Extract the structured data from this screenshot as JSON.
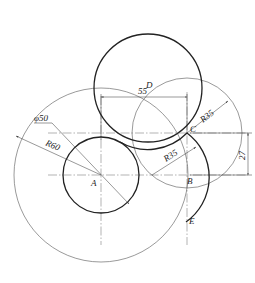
{
  "drawing": {
    "title": "",
    "points": [
      {
        "id": "A",
        "label": "A"
      },
      {
        "id": "B",
        "label": "B"
      },
      {
        "id": "C",
        "label": "C"
      },
      {
        "id": "D",
        "label": "D"
      },
      {
        "id": "E",
        "label": "E"
      }
    ],
    "dimensions": {
      "dia_small": "φ50",
      "radius_large": "R60",
      "radius_upper": "R35",
      "radius_lower": "R35",
      "horizontal": "55",
      "vertical": "27"
    },
    "colors": {
      "stroke": "#222222",
      "background": "#ffffff"
    }
  }
}
